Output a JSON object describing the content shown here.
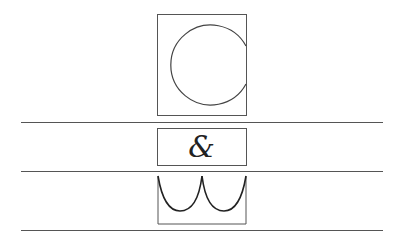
{
  "emblem": {
    "top_letter": "C",
    "middle_glyph": "&",
    "bottom_letter": "W"
  },
  "colors": {
    "stroke": "#555555",
    "glyph": "#222222",
    "background": "#ffffff"
  }
}
